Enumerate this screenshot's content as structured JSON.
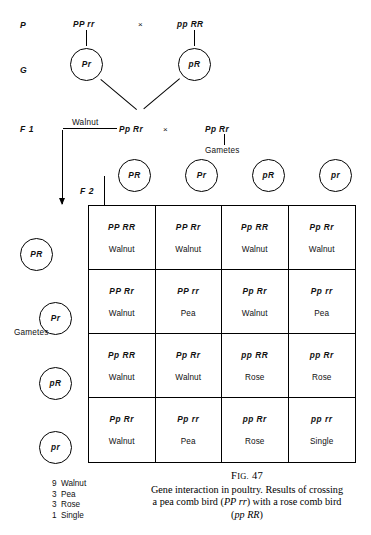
{
  "stages": {
    "parental_label": "P",
    "gamete_label": "G",
    "f1_label": "F 1",
    "f2_label": "F 2"
  },
  "parental": {
    "mother_genotype": "PP rr",
    "cross_symbol": "×",
    "father_genotype": "pp RR"
  },
  "parental_gametes": {
    "left": "Pr",
    "right": "pR"
  },
  "f1": {
    "phenotype": "Walnut",
    "left_genotype": "Pp Rr",
    "cross_symbol": "×",
    "right_genotype": "Pp Rr",
    "gametes_label": "Gametes"
  },
  "top_gametes": {
    "label": "Gametes",
    "items": [
      "PR",
      "Pr",
      "pR",
      "pr"
    ]
  },
  "side_gametes": {
    "label": "Gametes",
    "items": [
      "PR",
      "Pr",
      "pR",
      "pr"
    ]
  },
  "punnett": {
    "cells": [
      {
        "genotype": "PP RR",
        "phenotype": "Walnut"
      },
      {
        "genotype": "PP Rr",
        "phenotype": "Walnut"
      },
      {
        "genotype": "Pp RR",
        "phenotype": "Walnut"
      },
      {
        "genotype": "Pp Rr",
        "phenotype": "Walnut"
      },
      {
        "genotype": "PP Rr",
        "phenotype": "Walnut"
      },
      {
        "genotype": "PP rr",
        "phenotype": "Pea"
      },
      {
        "genotype": "Pp Rr",
        "phenotype": "Walnut"
      },
      {
        "genotype": "Pp rr",
        "phenotype": "Pea"
      },
      {
        "genotype": "Pp RR",
        "phenotype": "Walnut"
      },
      {
        "genotype": "Pp Rr",
        "phenotype": "Walnut"
      },
      {
        "genotype": "pp RR",
        "phenotype": "Rose"
      },
      {
        "genotype": "pp Rr",
        "phenotype": "Rose"
      },
      {
        "genotype": "Pp Rr",
        "phenotype": "Walnut"
      },
      {
        "genotype": "Pp rr",
        "phenotype": "Pea"
      },
      {
        "genotype": "pp Rr",
        "phenotype": "Rose"
      },
      {
        "genotype": "pp rr",
        "phenotype": "Single"
      }
    ]
  },
  "ratio": {
    "rows": [
      {
        "count": "9",
        "phenotype": "Walnut"
      },
      {
        "count": "3",
        "phenotype": "Pea"
      },
      {
        "count": "3",
        "phenotype": "Rose"
      },
      {
        "count": "1",
        "phenotype": "Single"
      }
    ]
  },
  "caption": {
    "fig_prefix": "F",
    "fig_word": "IG.",
    "fig_number": "47",
    "line1_a": "Gene interaction in poultry. Results of crossing",
    "line2_a": "a pea comb bird (",
    "line2_italic": "PP rr",
    "line2_b": ") with a rose comb bird",
    "line3_italic": "pp RR",
    "line3_open": "(",
    "line3_close": ")"
  }
}
